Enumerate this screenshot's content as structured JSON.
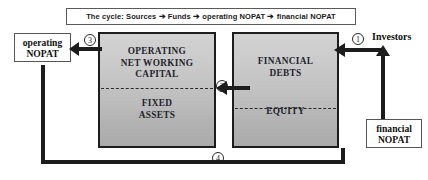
{
  "title_banner": {
    "text": "The cycle: Sources ➔ Funds ➔ operating NOPAT ➔ financial NOPAT"
  },
  "blocks": {
    "assets": {
      "top_label": "OPERATING\nNET WORKING\nCAPITAL",
      "top_label_line1": "OPERATING",
      "top_label_line2": "NET WORKING",
      "top_label_line3": "CAPITAL",
      "bottom_label_line1": "FIXED",
      "bottom_label_line2": "ASSETS"
    },
    "sources": {
      "top_label_line1": "FINANCIAL",
      "top_label_line2": "DEBTS",
      "bottom_label": "EQUITY"
    }
  },
  "tags": {
    "operating_nopat_line1": "operating",
    "operating_nopat_line2": "NOPAT",
    "financial_nopat_line1": "financial",
    "financial_nopat_line2": "NOPAT",
    "investors": "Investors"
  },
  "steps": {
    "one": "①",
    "two": "②",
    "three": "③",
    "four": "④"
  },
  "colors": {
    "outline": "#1d1d1d",
    "block_fill_top": "#d2d2d2",
    "block_fill_bottom": "#aaaaaa",
    "arrow": "#1c1c1c",
    "text": "#111111",
    "tag_border": "#555555"
  },
  "chart_data": {
    "type": "diagram",
    "title": "The cycle: Sources ➔ Funds ➔ operating NOPAT ➔ financial NOPAT",
    "nodes": [
      {
        "id": "investors",
        "label": "Investors",
        "shape": "text",
        "position": "top-right"
      },
      {
        "id": "financial_debts",
        "label": "FINANCIAL DEBTS",
        "shape": "block-upper",
        "position": "right"
      },
      {
        "id": "equity",
        "label": "EQUITY",
        "shape": "block-lower",
        "position": "right"
      },
      {
        "id": "operating_net_working_capital",
        "label": "OPERATING NET WORKING CAPITAL",
        "shape": "block-upper",
        "position": "left"
      },
      {
        "id": "fixed_assets",
        "label": "FIXED ASSETS",
        "shape": "block-lower",
        "position": "left"
      },
      {
        "id": "operating_nopat",
        "label": "operating NOPAT",
        "shape": "outline-box",
        "position": "far-left"
      },
      {
        "id": "financial_nopat",
        "label": "financial NOPAT",
        "shape": "outline-box",
        "position": "bottom-right"
      }
    ],
    "edges": [
      {
        "step": "①",
        "from": "investors",
        "to": "financial_debts",
        "direction": "left",
        "label": "1"
      },
      {
        "step": "②",
        "from": "financial_debts",
        "to": "fixed_assets",
        "direction": "left",
        "label": "2"
      },
      {
        "step": "③",
        "from": "operating_net_working_capital",
        "to": "operating_nopat",
        "direction": "left",
        "label": "3"
      },
      {
        "step": "④",
        "from": "operating_nopat",
        "to": "financial_nopat",
        "direction": "bottom-loop",
        "label": "4"
      },
      {
        "step": "",
        "from": "financial_nopat",
        "to": "investors",
        "direction": "up",
        "label": ""
      }
    ]
  }
}
